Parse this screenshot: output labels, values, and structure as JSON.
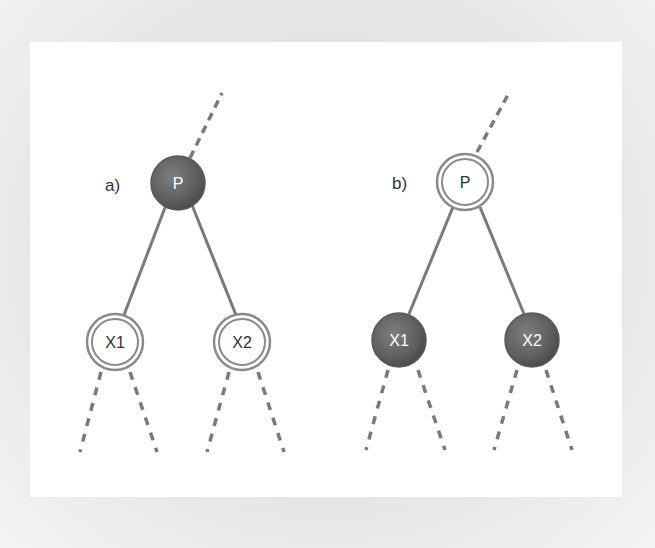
{
  "diagram": {
    "type": "binary-tree-comparison",
    "panels": [
      {
        "label": "a)",
        "parent": {
          "label": "P",
          "style": "filled-dark"
        },
        "children": [
          {
            "label": "X1",
            "style": "double-ring-white"
          },
          {
            "label": "X2",
            "style": "double-ring-white"
          }
        ]
      },
      {
        "label": "b)",
        "parent": {
          "label": "P",
          "style": "double-ring-white"
        },
        "children": [
          {
            "label": "X1",
            "style": "filled-dark"
          },
          {
            "label": "X2",
            "style": "filled-dark"
          }
        ]
      }
    ],
    "colors": {
      "filled_node": "#6a6a6a",
      "edge": "#7a7a7a",
      "ring": "#8a8a8a",
      "background": "#ffffff",
      "frame": "#e4e4e4"
    }
  }
}
